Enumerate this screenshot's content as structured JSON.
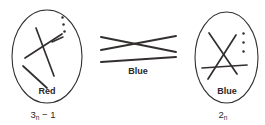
{
  "figure": {
    "type": "knot-tangle-diagram",
    "background_color": "#ffffff",
    "ink_color": "#332f2f",
    "panels": [
      {
        "id": "left-tangle",
        "shape": "ellipse",
        "inner_label": "Red",
        "caption": "3",
        "caption_subscript": "n",
        "caption_suffix": " − 1",
        "ellipsis_dots": 3,
        "crossings": 2
      },
      {
        "id": "middle-tangle",
        "shape": "open-crossing",
        "inner_label": "",
        "caption_label": "Blue",
        "crossings": 1,
        "strands": 3
      },
      {
        "id": "right-tangle",
        "shape": "ellipse",
        "inner_label": "Blue",
        "caption": "2",
        "caption_subscript": "n",
        "caption_suffix": "",
        "ellipsis_dots": 3,
        "crossings": 2
      }
    ]
  },
  "labels": {
    "left_inner": "Red",
    "left_caption_base": "3",
    "left_caption_sub": "n",
    "left_caption_tail": " − 1",
    "middle_caption": "Blue",
    "right_inner": "Blue",
    "right_caption_base": "2",
    "right_caption_sub": "n",
    "right_caption_tail": ""
  }
}
